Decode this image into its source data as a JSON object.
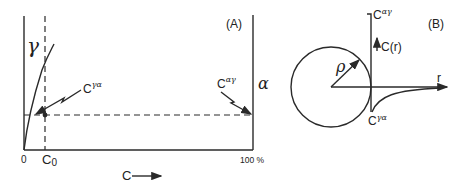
{
  "panel_a": {
    "label": "(A)",
    "phase_left": "γ",
    "phase_right": "α",
    "origin_label": "0",
    "c0_label": "C",
    "c0_sub": "0",
    "end_label": "100 %",
    "x_axis_label": "C",
    "c_gamma_alpha": {
      "base": "C",
      "sup": "γα"
    },
    "c_alpha_gamma": {
      "base": "C",
      "sup": "αγ"
    }
  },
  "panel_b": {
    "label": "(B)",
    "radius_label": "ρ",
    "r_axis_label": "r",
    "cr_label": "C(r)",
    "c_alpha_gamma": {
      "base": "C",
      "sup": "αγ"
    },
    "c_gamma_alpha": {
      "base": "C",
      "sup": "γα"
    }
  },
  "colors": {
    "ink": "#2a2a2a",
    "background": "#ffffff"
  }
}
